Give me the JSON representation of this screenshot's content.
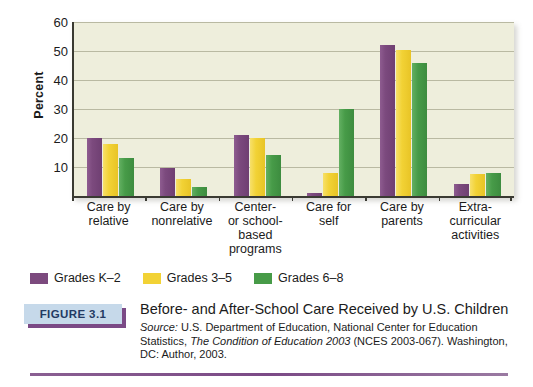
{
  "chart_data": {
    "type": "bar",
    "title": "Before- and After-School Care Received by U.S. Children",
    "xlabel": "",
    "ylabel": "Percent",
    "ylim": [
      0,
      60
    ],
    "yticks": [
      10,
      20,
      30,
      40,
      50,
      60
    ],
    "grid": true,
    "legend_position": "below-plot-left",
    "categories": [
      "Care by relative",
      "Care by nonrelative",
      "Center- or school-based programs",
      "Care for self",
      "Care by parents",
      "Extra-curricular activities"
    ],
    "category_lines": [
      [
        "Care by",
        "relative"
      ],
      [
        "Care by",
        "nonrelative"
      ],
      [
        "Center-",
        "or school-",
        "based",
        "programs"
      ],
      [
        "Care for",
        "self"
      ],
      [
        "Care by",
        "parents"
      ],
      [
        "Extra-",
        "curricular",
        "activities"
      ]
    ],
    "series": [
      {
        "name": "Grades K–2",
        "color": "#7c4a7e",
        "values": [
          20,
          9.5,
          21,
          1,
          52,
          4
        ]
      },
      {
        "name": "Grades 3–5",
        "color": "#f2d235",
        "values": [
          18,
          6,
          20,
          8,
          50.5,
          7.5
        ]
      },
      {
        "name": "Grades 6–8",
        "color": "#479b48",
        "values": [
          13,
          3,
          14,
          30,
          46,
          8
        ]
      }
    ]
  },
  "plot": {
    "background_color": "#eeeedc",
    "axis_color": "#3a3a32",
    "gridline_color": "#b9b9a2"
  },
  "legend": [
    {
      "label": "Grades K–2",
      "color": "#7c4a7e"
    },
    {
      "label": "Grades 3–5",
      "color": "#f2d235"
    },
    {
      "label": "Grades 6–8",
      "color": "#479b48"
    }
  ],
  "caption": {
    "badge_label": "FIGURE 3.1",
    "badge_bg": "#c6d9ea",
    "badge_text_color": "#223a63",
    "badge_shadow_color": "#7b4a86",
    "title": "Before- and After-School Care Received by U.S. Children",
    "source_label": "Source:",
    "source_part1": " U.S. Department of Education, National Center for Education Statistics,",
    "source_italic": "The Condition of Education 2003",
    "source_part2": " (NCES 2003-067). Washington, DC: Author, 2003.",
    "rule_color": "#7b4a86"
  }
}
